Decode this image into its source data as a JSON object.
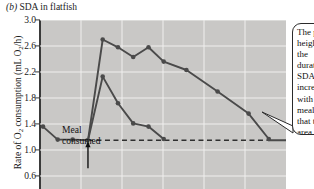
{
  "figure": {
    "panel_label": "(b)",
    "title": "SDA in flatfish"
  },
  "axes": {
    "ylabel_prefix": "Rate of O",
    "ylabel_sub1": "2",
    "ylabel_mid": " consumption (mL O",
    "ylabel_sub2": "2",
    "ylabel_suffix": "/h)",
    "ylabel_full": "Rate of O2 consumption (mL O2/h)",
    "yticks": [
      "3.0",
      "2.6",
      "2.2",
      "1.8",
      "1.4",
      "1.0",
      "0.6"
    ]
  },
  "annotations": {
    "meal_line1": "Meal",
    "meal_line2": "consumed",
    "callout_text": "The peak height and the duration of SDA both increase with larger meals, so that the area under the curve (SDA) increases with the food eaten."
  },
  "colors": {
    "plot_background": "#c9c8c6",
    "gridline": "#f0efee",
    "curve": "#4a4a4a",
    "axis": "#3a3a3a",
    "text": "#1b1b1b"
  },
  "chart_data": {
    "type": "line",
    "title": "SDA in flatfish",
    "xlabel": "",
    "ylabel": "Rate of O2 consumption (mL O2/h)",
    "ylim": [
      0.4,
      3.0
    ],
    "xlim": [
      0,
      10
    ],
    "grid": true,
    "legend": "none",
    "baseline_value": 1.15,
    "meal_time": 1.95,
    "series": [
      {
        "name": "pre-meal baseline",
        "x": [
          0.12,
          0.72,
          1.33,
          1.93
        ],
        "values": [
          1.36,
          1.16,
          1.16,
          1.15
        ]
      },
      {
        "name": "large meal",
        "x": [
          1.95,
          2.55,
          3.17,
          3.79,
          4.41,
          5.03,
          5.95,
          7.22,
          8.48,
          9.3
        ],
        "values": [
          1.15,
          2.7,
          2.58,
          2.43,
          2.58,
          2.36,
          2.23,
          1.9,
          1.56,
          1.17
        ]
      },
      {
        "name": "small meal",
        "x": [
          1.95,
          2.55,
          3.17,
          3.79,
          4.41,
          5.03
        ],
        "values": [
          1.15,
          2.13,
          1.72,
          1.41,
          1.36,
          1.17
        ]
      },
      {
        "name": "post-SDA baseline",
        "x": [
          9.3,
          10.0
        ],
        "values": [
          1.15,
          1.15
        ]
      }
    ],
    "dashed_baseline": {
      "y": 1.15,
      "x_start": 1.95,
      "x_end": 9.3
    }
  }
}
